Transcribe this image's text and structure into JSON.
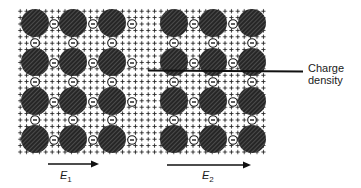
{
  "figure": {
    "type": "lattice-charge-diagram",
    "annotation": {
      "line1": "Charge",
      "line2": "density"
    },
    "fields": [
      {
        "symbol": "E",
        "subscript": "1",
        "direction": "right"
      },
      {
        "symbol": "E",
        "subscript": "2",
        "direction": "right"
      }
    ],
    "lattices": [
      {
        "name": "left",
        "rows": 4,
        "cols": 3,
        "ion_symbol": "−",
        "background_symbol": "+"
      },
      {
        "name": "right",
        "rows": 4,
        "cols": 3,
        "ion_symbol": "−",
        "background_symbol": "+"
      }
    ],
    "colors": {
      "atom": "#2b2b2b",
      "atom_hatch": "#6a6a6a",
      "ink": "#1a1a1a",
      "background": "#ffffff"
    }
  }
}
